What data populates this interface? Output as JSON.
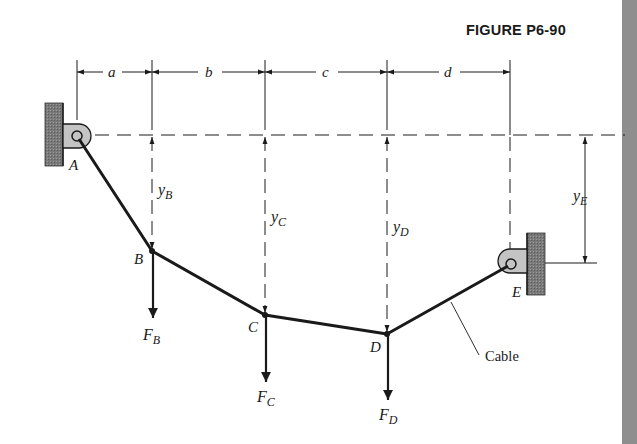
{
  "figure": {
    "title": "FIGURE P6-90",
    "dimensions": {
      "horizontal": [
        "a",
        "b",
        "c",
        "d"
      ],
      "vertical": [
        {
          "base": "y",
          "sub": "B"
        },
        {
          "base": "y",
          "sub": "C"
        },
        {
          "base": "y",
          "sub": "D"
        },
        {
          "base": "y",
          "sub": "E"
        }
      ]
    },
    "points": [
      {
        "label": "A",
        "role": "pin support (left wall)"
      },
      {
        "label": "B",
        "role": "load point"
      },
      {
        "label": "C",
        "role": "load point"
      },
      {
        "label": "D",
        "role": "load point"
      },
      {
        "label": "E",
        "role": "pin support (right wall)"
      }
    ],
    "forces": [
      {
        "base": "F",
        "sub": "B"
      },
      {
        "base": "F",
        "sub": "C"
      },
      {
        "base": "F",
        "sub": "D"
      }
    ],
    "callout": "Cable",
    "colors": {
      "ink": "#1a1a1a",
      "wall": "#6e6e6e",
      "bracket": "#c4c4c4",
      "edge_strip": "#8e8e8e"
    }
  }
}
